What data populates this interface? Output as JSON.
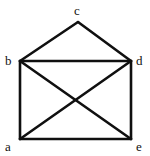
{
  "figure": {
    "kind": "undirected-graph-diagram",
    "background_color": "#ffffff",
    "edge_color": "#101010",
    "label_color": "#101010",
    "edge_width": 2.6,
    "width": 150,
    "height": 156
  },
  "graph": {
    "vertices": [
      {
        "id": "a",
        "label": "a",
        "x": 20,
        "y": 139,
        "label_x": 5,
        "label_y": 140
      },
      {
        "id": "b",
        "label": "b",
        "x": 20,
        "y": 61,
        "label_x": 5,
        "label_y": 54
      },
      {
        "id": "c",
        "label": "c",
        "x": 78,
        "y": 22,
        "label_x": 74,
        "label_y": 4
      },
      {
        "id": "d",
        "label": "d",
        "x": 131,
        "y": 61,
        "label_x": 136,
        "label_y": 54
      },
      {
        "id": "e",
        "label": "e",
        "x": 131,
        "y": 139,
        "label_x": 136,
        "label_y": 140
      }
    ],
    "edges": [
      {
        "from": "b",
        "to": "c"
      },
      {
        "from": "c",
        "to": "d"
      },
      {
        "from": "b",
        "to": "d"
      },
      {
        "from": "b",
        "to": "a"
      },
      {
        "from": "d",
        "to": "e"
      },
      {
        "from": "a",
        "to": "e"
      },
      {
        "from": "b",
        "to": "e"
      },
      {
        "from": "a",
        "to": "d"
      }
    ]
  },
  "chart_data": {
    "type": "diagram",
    "title": "",
    "nodes": [
      "a",
      "b",
      "c",
      "d",
      "e"
    ],
    "edges": [
      [
        "b",
        "c"
      ],
      [
        "c",
        "d"
      ],
      [
        "b",
        "d"
      ],
      [
        "a",
        "b"
      ],
      [
        "d",
        "e"
      ],
      [
        "a",
        "e"
      ],
      [
        "b",
        "e"
      ],
      [
        "a",
        "d"
      ]
    ],
    "edge_count": 8,
    "node_count": 5,
    "degrees": {
      "a": 3,
      "b": 4,
      "c": 2,
      "d": 4,
      "e": 3
    }
  }
}
